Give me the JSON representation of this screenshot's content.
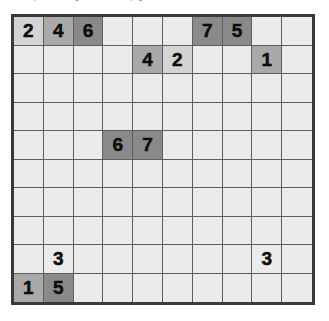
{
  "caption": {
    "text": "and the puzzle strategies t learned on page 34"
  },
  "board": {
    "rows": 10,
    "columns": 10,
    "colors": {
      "border": "#3a3a3a",
      "gridline": "#5e5e5e",
      "cell_empty": "#ebebeb",
      "shade_light": "#d4d4d4",
      "shade_medium": "#a9a9a9",
      "shade_dark": "#898989",
      "digit": "#0d0d0d"
    },
    "cells": [
      [
        {
          "value": "2",
          "shade": "light"
        },
        {
          "value": "4",
          "shade": "medium"
        },
        {
          "value": "6",
          "shade": "dark"
        },
        {
          "value": "",
          "shade": "none"
        },
        {
          "value": "",
          "shade": "none"
        },
        {
          "value": "",
          "shade": "none"
        },
        {
          "value": "7",
          "shade": "dark"
        },
        {
          "value": "5",
          "shade": "dark"
        },
        {
          "value": "",
          "shade": "none"
        },
        {
          "value": "",
          "shade": "none"
        }
      ],
      [
        {
          "value": "",
          "shade": "none"
        },
        {
          "value": "",
          "shade": "none"
        },
        {
          "value": "",
          "shade": "none"
        },
        {
          "value": "",
          "shade": "none"
        },
        {
          "value": "4",
          "shade": "medium"
        },
        {
          "value": "2",
          "shade": "light"
        },
        {
          "value": "",
          "shade": "none"
        },
        {
          "value": "",
          "shade": "none"
        },
        {
          "value": "1",
          "shade": "medium"
        },
        {
          "value": "",
          "shade": "none"
        }
      ],
      [
        {
          "value": "",
          "shade": "none"
        },
        {
          "value": "",
          "shade": "none"
        },
        {
          "value": "",
          "shade": "none"
        },
        {
          "value": "",
          "shade": "none"
        },
        {
          "value": "",
          "shade": "none"
        },
        {
          "value": "",
          "shade": "none"
        },
        {
          "value": "",
          "shade": "none"
        },
        {
          "value": "",
          "shade": "none"
        },
        {
          "value": "",
          "shade": "none"
        },
        {
          "value": "",
          "shade": "none"
        }
      ],
      [
        {
          "value": "",
          "shade": "none"
        },
        {
          "value": "",
          "shade": "none"
        },
        {
          "value": "",
          "shade": "none"
        },
        {
          "value": "",
          "shade": "none"
        },
        {
          "value": "",
          "shade": "none"
        },
        {
          "value": "",
          "shade": "none"
        },
        {
          "value": "",
          "shade": "none"
        },
        {
          "value": "",
          "shade": "none"
        },
        {
          "value": "",
          "shade": "none"
        },
        {
          "value": "",
          "shade": "none"
        }
      ],
      [
        {
          "value": "",
          "shade": "none"
        },
        {
          "value": "",
          "shade": "none"
        },
        {
          "value": "",
          "shade": "none"
        },
        {
          "value": "6",
          "shade": "dark"
        },
        {
          "value": "7",
          "shade": "dark"
        },
        {
          "value": "",
          "shade": "none"
        },
        {
          "value": "",
          "shade": "none"
        },
        {
          "value": "",
          "shade": "none"
        },
        {
          "value": "",
          "shade": "none"
        },
        {
          "value": "",
          "shade": "none"
        }
      ],
      [
        {
          "value": "",
          "shade": "none"
        },
        {
          "value": "",
          "shade": "none"
        },
        {
          "value": "",
          "shade": "none"
        },
        {
          "value": "",
          "shade": "none"
        },
        {
          "value": "",
          "shade": "none"
        },
        {
          "value": "",
          "shade": "none"
        },
        {
          "value": "",
          "shade": "none"
        },
        {
          "value": "",
          "shade": "none"
        },
        {
          "value": "",
          "shade": "none"
        },
        {
          "value": "",
          "shade": "none"
        }
      ],
      [
        {
          "value": "",
          "shade": "none"
        },
        {
          "value": "",
          "shade": "none"
        },
        {
          "value": "",
          "shade": "none"
        },
        {
          "value": "",
          "shade": "none"
        },
        {
          "value": "",
          "shade": "none"
        },
        {
          "value": "",
          "shade": "none"
        },
        {
          "value": "",
          "shade": "none"
        },
        {
          "value": "",
          "shade": "none"
        },
        {
          "value": "",
          "shade": "none"
        },
        {
          "value": "",
          "shade": "none"
        }
      ],
      [
        {
          "value": "",
          "shade": "none"
        },
        {
          "value": "",
          "shade": "none"
        },
        {
          "value": "",
          "shade": "none"
        },
        {
          "value": "",
          "shade": "none"
        },
        {
          "value": "",
          "shade": "none"
        },
        {
          "value": "",
          "shade": "none"
        },
        {
          "value": "",
          "shade": "none"
        },
        {
          "value": "",
          "shade": "none"
        },
        {
          "value": "",
          "shade": "none"
        },
        {
          "value": "",
          "shade": "none"
        }
      ],
      [
        {
          "value": "",
          "shade": "none"
        },
        {
          "value": "3",
          "shade": "none"
        },
        {
          "value": "",
          "shade": "none"
        },
        {
          "value": "",
          "shade": "none"
        },
        {
          "value": "",
          "shade": "none"
        },
        {
          "value": "",
          "shade": "none"
        },
        {
          "value": "",
          "shade": "none"
        },
        {
          "value": "",
          "shade": "none"
        },
        {
          "value": "3",
          "shade": "none"
        },
        {
          "value": "",
          "shade": "none"
        }
      ],
      [
        {
          "value": "1",
          "shade": "medium"
        },
        {
          "value": "5",
          "shade": "dark"
        },
        {
          "value": "",
          "shade": "none"
        },
        {
          "value": "",
          "shade": "none"
        },
        {
          "value": "",
          "shade": "none"
        },
        {
          "value": "",
          "shade": "none"
        },
        {
          "value": "",
          "shade": "none"
        },
        {
          "value": "",
          "shade": "none"
        },
        {
          "value": "",
          "shade": "none"
        },
        {
          "value": "",
          "shade": "none"
        }
      ]
    ]
  }
}
